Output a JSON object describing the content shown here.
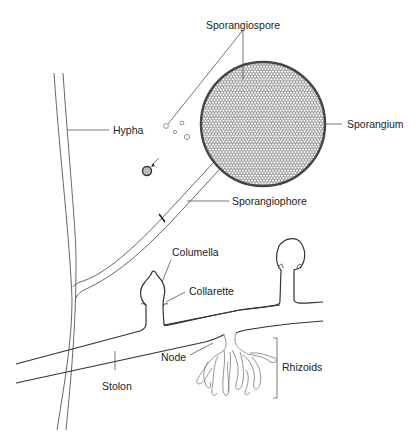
{
  "diagram": {
    "labels": {
      "sporangiospore": "Sporangiospore",
      "sporangium": "Sporangium",
      "hypha": "Hypha",
      "sporangiophore": "Sporangiophore",
      "columella": "Columella",
      "collarette": "Collarette",
      "node": "Node",
      "rhizoids": "Rhizoids",
      "stolon": "Stolon"
    },
    "colors": {
      "line": "#333333",
      "sporangium_outline": "#444444",
      "spore_fill": "#ffffff",
      "spore_stroke": "#888888",
      "leader": "#555555"
    }
  }
}
